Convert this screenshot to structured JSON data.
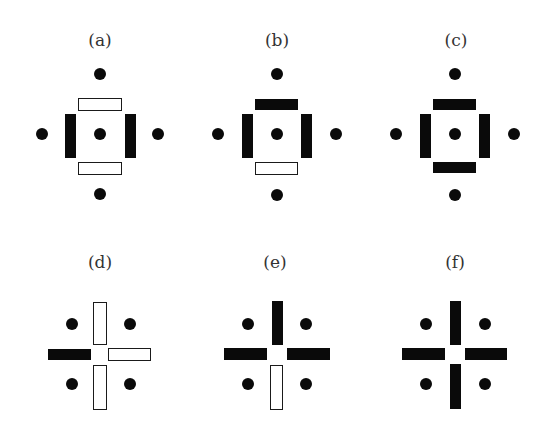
{
  "figure": {
    "panels": [
      {
        "id": "a",
        "label": "(a)",
        "label_pos": [
          100,
          40
        ],
        "dots": [
          [
            100,
            74
          ],
          [
            42,
            134
          ],
          [
            100,
            134
          ],
          [
            158,
            134
          ],
          [
            100,
            194
          ]
        ],
        "bars": [
          {
            "x": 78,
            "y": 98,
            "w": 44,
            "h": 13,
            "style": "open",
            "role": "top"
          },
          {
            "x": 65,
            "y": 114,
            "w": 11,
            "h": 44,
            "style": "filled",
            "role": "left"
          },
          {
            "x": 125,
            "y": 114,
            "w": 11,
            "h": 44,
            "style": "filled",
            "role": "right"
          },
          {
            "x": 78,
            "y": 162,
            "w": 44,
            "h": 13,
            "style": "open",
            "role": "bottom"
          }
        ]
      },
      {
        "id": "b",
        "label": "(b)",
        "label_pos": [
          277,
          40
        ],
        "dots": [
          [
            277,
            74
          ],
          [
            218,
            134
          ],
          [
            277,
            134
          ],
          [
            336,
            134
          ],
          [
            277,
            195
          ]
        ],
        "bars": [
          {
            "x": 255,
            "y": 99,
            "w": 43,
            "h": 11,
            "style": "filled",
            "role": "top"
          },
          {
            "x": 242,
            "y": 114,
            "w": 11,
            "h": 44,
            "style": "filled",
            "role": "left"
          },
          {
            "x": 301,
            "y": 114,
            "w": 11,
            "h": 44,
            "style": "filled",
            "role": "right"
          },
          {
            "x": 255,
            "y": 162,
            "w": 43,
            "h": 13,
            "style": "open",
            "role": "bottom"
          }
        ]
      },
      {
        "id": "c",
        "label": "(c)",
        "label_pos": [
          456,
          40
        ],
        "dots": [
          [
            455,
            74
          ],
          [
            396,
            134
          ],
          [
            455,
            134
          ],
          [
            514,
            134
          ],
          [
            455,
            195
          ]
        ],
        "bars": [
          {
            "x": 433,
            "y": 99,
            "w": 43,
            "h": 11,
            "style": "filled",
            "role": "top"
          },
          {
            "x": 420,
            "y": 114,
            "w": 11,
            "h": 44,
            "style": "filled",
            "role": "left"
          },
          {
            "x": 479,
            "y": 114,
            "w": 11,
            "h": 44,
            "style": "filled",
            "role": "right"
          },
          {
            "x": 433,
            "y": 162,
            "w": 43,
            "h": 11,
            "style": "filled",
            "role": "bottom"
          }
        ]
      },
      {
        "id": "d",
        "label": "(d)",
        "label_pos": [
          100,
          262
        ],
        "dots": [
          [
            72,
            324
          ],
          [
            130,
            324
          ],
          [
            72,
            384
          ],
          [
            130,
            384
          ]
        ],
        "bars": [
          {
            "x": 93,
            "y": 302,
            "w": 14,
            "h": 43,
            "style": "open",
            "role": "top"
          },
          {
            "x": 48,
            "y": 349,
            "w": 43,
            "h": 11,
            "style": "filled",
            "role": "left"
          },
          {
            "x": 108,
            "y": 348,
            "w": 43,
            "h": 13,
            "style": "open",
            "role": "right"
          },
          {
            "x": 93,
            "y": 365,
            "w": 14,
            "h": 45,
            "style": "open",
            "role": "bottom"
          }
        ]
      },
      {
        "id": "e",
        "label": "(e)",
        "label_pos": [
          275,
          262
        ],
        "dots": [
          [
            248,
            324
          ],
          [
            306,
            324
          ],
          [
            248,
            384
          ],
          [
            306,
            384
          ]
        ],
        "bars": [
          {
            "x": 272,
            "y": 301,
            "w": 11,
            "h": 44,
            "style": "filled",
            "role": "top"
          },
          {
            "x": 224,
            "y": 348,
            "w": 43,
            "h": 12,
            "style": "filled",
            "role": "left"
          },
          {
            "x": 287,
            "y": 348,
            "w": 43,
            "h": 12,
            "style": "filled",
            "role": "right"
          },
          {
            "x": 270,
            "y": 365,
            "w": 13,
            "h": 45,
            "style": "open",
            "role": "bottom"
          }
        ]
      },
      {
        "id": "f",
        "label": "(f)",
        "label_pos": [
          455,
          262
        ],
        "dots": [
          [
            426,
            324
          ],
          [
            485,
            324
          ],
          [
            426,
            384
          ],
          [
            485,
            384
          ]
        ],
        "bars": [
          {
            "x": 450,
            "y": 301,
            "w": 11,
            "h": 44,
            "style": "filled",
            "role": "top"
          },
          {
            "x": 402,
            "y": 348,
            "w": 43,
            "h": 12,
            "style": "filled",
            "role": "left"
          },
          {
            "x": 465,
            "y": 348,
            "w": 42,
            "h": 12,
            "style": "filled",
            "role": "right"
          },
          {
            "x": 450,
            "y": 364,
            "w": 11,
            "h": 45,
            "style": "filled",
            "role": "bottom"
          }
        ]
      }
    ],
    "colors": {
      "ink": "#0a0a0a",
      "background": "#ffffff"
    }
  }
}
